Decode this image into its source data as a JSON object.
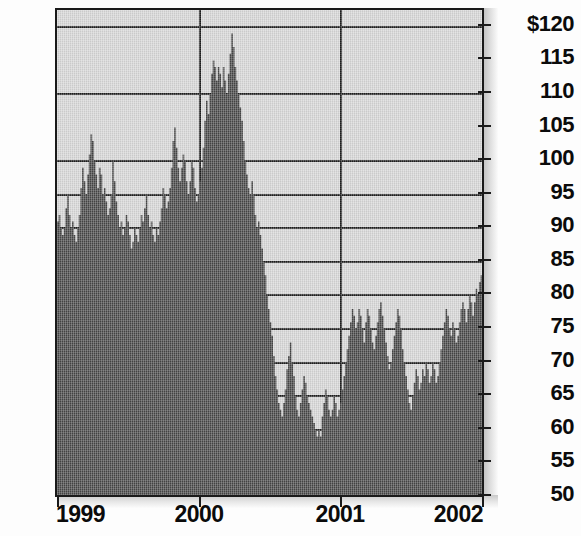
{
  "chart_data": {
    "type": "area",
    "title": "",
    "subtitle": "",
    "xlabel": "",
    "ylabel": "",
    "grid": true,
    "legend": null,
    "x_tick_labels": [
      "1999",
      "2000",
      "2001",
      "2002"
    ],
    "y_tick_labels": [
      "$120",
      "115",
      "110",
      "105",
      "100",
      "95",
      "90",
      "85",
      "80",
      "75",
      "70",
      "65",
      "60",
      "55",
      "50"
    ],
    "y_tick_values": [
      120,
      115,
      110,
      105,
      100,
      95,
      90,
      85,
      80,
      75,
      70,
      65,
      60,
      55,
      50
    ],
    "ylim": [
      50,
      122.5
    ],
    "xlim": [
      "1999",
      "2002"
    ],
    "currency_symbol": "$",
    "series_name": "Share price",
    "colors": {
      "area_fill": "#464646",
      "plot_background": "#d7d7d7",
      "gridline": "#1e1e1e",
      "axis": "#1a1a1a",
      "label_text": "#0b0b0b",
      "page_background": "#fdfdfd"
    },
    "values": [
      91,
      92,
      90,
      89,
      90,
      93,
      95,
      92,
      90,
      91,
      89,
      88,
      90,
      92,
      96,
      99,
      97,
      95,
      98,
      101,
      104,
      103,
      100,
      98,
      96,
      99,
      98,
      95,
      96,
      94,
      92,
      93,
      95,
      100,
      97,
      94,
      92,
      90,
      91,
      89,
      90,
      92,
      91,
      89,
      87,
      88,
      90,
      89,
      88,
      90,
      92,
      91,
      93,
      95,
      92,
      90,
      91,
      89,
      88,
      90,
      89,
      91,
      93,
      96,
      95,
      93,
      94,
      96,
      99,
      103,
      105,
      102,
      99,
      97,
      99,
      101,
      100,
      97,
      95,
      97,
      100,
      99,
      96,
      94,
      95,
      97,
      99,
      102,
      106,
      109,
      107,
      110,
      113,
      115,
      114,
      112,
      114,
      113,
      111,
      114,
      112,
      110,
      113,
      116,
      119,
      117,
      114,
      112,
      110,
      108,
      106,
      103,
      100,
      98,
      96,
      95,
      97,
      95,
      92,
      90,
      91,
      89,
      87,
      85,
      83,
      80,
      78,
      76,
      74,
      71,
      68,
      66,
      64,
      63,
      62,
      64,
      66,
      69,
      71,
      73,
      70,
      68,
      65,
      63,
      62,
      64,
      66,
      68,
      67,
      65,
      64,
      63,
      62,
      61,
      60,
      59,
      60,
      59,
      62,
      64,
      66,
      65,
      63,
      62,
      63,
      65,
      64,
      62,
      63,
      64,
      66,
      68,
      70,
      72,
      74,
      76,
      78,
      77,
      75,
      76,
      78,
      77,
      75,
      73,
      76,
      78,
      77,
      75,
      73,
      72,
      74,
      76,
      78,
      79,
      77,
      75,
      73,
      71,
      69,
      70,
      72,
      74,
      76,
      78,
      77,
      75,
      72,
      70,
      68,
      66,
      64,
      63,
      65,
      67,
      69,
      68,
      66,
      67,
      69,
      68,
      70,
      69,
      67,
      68,
      70,
      69,
      67,
      68,
      70,
      72,
      74,
      76,
      78,
      77,
      75,
      74,
      76,
      75,
      73,
      74,
      76,
      78,
      79,
      78,
      76,
      78,
      80,
      79,
      77,
      79,
      81,
      80,
      82,
      83,
      82
    ]
  },
  "axis": {
    "y_ticks": [
      {
        "label": "$120",
        "value": 120
      },
      {
        "label": "115",
        "value": 115
      },
      {
        "label": "110",
        "value": 110
      },
      {
        "label": "105",
        "value": 105
      },
      {
        "label": "100",
        "value": 100
      },
      {
        "label": "95",
        "value": 95
      },
      {
        "label": "90",
        "value": 90
      },
      {
        "label": "85",
        "value": 85
      },
      {
        "label": "80",
        "value": 80
      },
      {
        "label": "75",
        "value": 75
      },
      {
        "label": "70",
        "value": 70
      },
      {
        "label": "65",
        "value": 65
      },
      {
        "label": "60",
        "value": 60
      },
      {
        "label": "55",
        "value": 55
      },
      {
        "label": "50",
        "value": 50
      }
    ],
    "x_ticks": [
      {
        "label": "1999",
        "pos": 0.0
      },
      {
        "label": "2000",
        "pos": 0.3333
      },
      {
        "label": "2001",
        "pos": 0.6667
      },
      {
        "label": "2002",
        "pos": 1.0
      }
    ],
    "gridline_values": [
      120,
      110,
      100,
      95,
      90,
      85,
      80,
      75,
      70,
      65,
      60,
      55
    ]
  }
}
